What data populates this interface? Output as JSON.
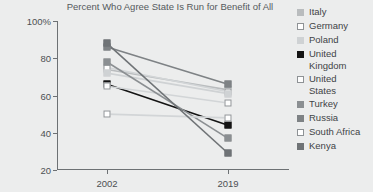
{
  "chart_data": {
    "type": "line",
    "title": "Percent Who Agree State Is Run for Benefit of All",
    "xlabel": "",
    "ylabel": "",
    "categories": [
      "2002",
      "2019"
    ],
    "ylim": [
      20,
      100
    ],
    "yticks": [
      "100%",
      "80",
      "60",
      "40",
      "20"
    ],
    "ytick_values": [
      100,
      80,
      60,
      40,
      20
    ],
    "grid": false,
    "legend_position": "right",
    "series": [
      {
        "name": "Italy",
        "values": [
          74,
          63
        ],
        "color": "#b9bcbe"
      },
      {
        "name": "Germany",
        "values": [
          75,
          62
        ],
        "color": "#ffffff"
      },
      {
        "name": "Poland",
        "values": [
          72,
          61
        ],
        "color": "#cfd2d4"
      },
      {
        "name": "United\nKingdom",
        "values": [
          66,
          44
        ],
        "color": "#141414"
      },
      {
        "name": "United\nStates",
        "values": [
          65,
          56
        ],
        "color": "#fdfdfd"
      },
      {
        "name": "Turkey",
        "values": [
          78,
          37
        ],
        "color": "#8b8f92"
      },
      {
        "name": "Russia",
        "values": [
          86,
          66
        ],
        "color": "#7e8285"
      },
      {
        "name": "South Africa",
        "values": [
          50,
          48
        ],
        "color": "#ffffff"
      },
      {
        "name": "Kenya",
        "values": [
          88,
          29
        ],
        "color": "#6f7376"
      }
    ]
  },
  "legend": {
    "items": [
      {
        "label": "Italy",
        "color": "#b9bcbe"
      },
      {
        "label": "Germany",
        "color": "#ffffff"
      },
      {
        "label": "Poland",
        "color": "#cfd2d4"
      },
      {
        "label": "United\nKingdom",
        "color": "#141414"
      },
      {
        "label": "United\nStates",
        "color": "#fdfdfd"
      },
      {
        "label": "Turkey",
        "color": "#8b8f92"
      },
      {
        "label": "Russia",
        "color": "#7e8285"
      },
      {
        "label": "South Africa",
        "color": "#ffffff"
      },
      {
        "label": "Kenya",
        "color": "#6f7376"
      }
    ]
  }
}
